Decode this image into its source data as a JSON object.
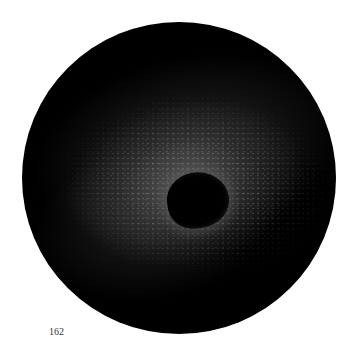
{
  "image": {
    "subject": "crater-on-lunar-surface",
    "frame": "circular"
  },
  "page_number": "162"
}
